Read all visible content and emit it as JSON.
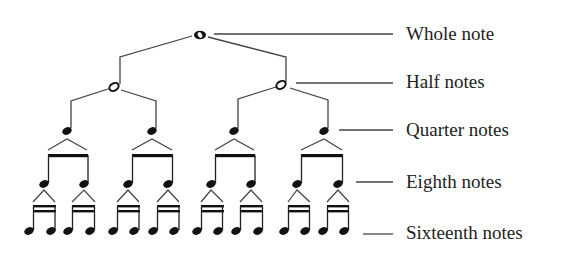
{
  "diagram": {
    "colors": {
      "ink": "#222222",
      "line": "#444444",
      "background": "#ffffff"
    },
    "labels": [
      {
        "id": "whole",
        "text": "Whole note"
      },
      {
        "id": "half",
        "text": "Half notes"
      },
      {
        "id": "quarter",
        "text": "Quarter notes"
      },
      {
        "id": "eighth",
        "text": "Eighth notes"
      },
      {
        "id": "sixteenth",
        "text": "Sixteenth notes"
      }
    ],
    "levels": [
      {
        "name": "Whole note",
        "count": 1
      },
      {
        "name": "Half notes",
        "count": 2
      },
      {
        "name": "Quarter notes",
        "count": 4
      },
      {
        "name": "Eighth notes",
        "count": 8
      },
      {
        "name": "Sixteenth notes",
        "count": 16
      }
    ]
  }
}
